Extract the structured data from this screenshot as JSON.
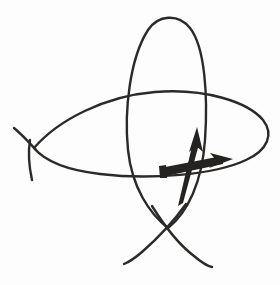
{
  "document": {
    "title": "Hand-drawn sketch",
    "kind": "freehand-ink-drawing",
    "description": "Two large intersecting hand-drawn loops (a tall vertical oval and a wide horizontal oval), each closing with a self-crossing and trailing ends, overlaid by two thick ink arrows meeting near the centre: one pointing up and one pointing right.",
    "width": 280,
    "height": 285
  },
  "canvas": {
    "background_color": "#fdfdfd",
    "ink_color": "#2b2a29",
    "thin_stroke_width": 2.2,
    "thick_arrow_color": "#242322"
  },
  "strokes": [
    {
      "name": "vertical-loop",
      "label": "Tall vertical oval loop with crossed tails at bottom",
      "color": "#2b2a29",
      "width": 2.4,
      "path": "M168 228 C 150 214, 132 188, 128 150 C 124 110, 130 58, 148 30 C 158 15, 178 13, 190 28 C 205 47, 208 96, 205 140 C 202 182, 188 212, 168 228"
    },
    {
      "name": "vertical-loop-left-tail",
      "label": "Left trailing tail of vertical loop",
      "color": "#2b2a29",
      "width": 2.4,
      "path": "M186 204 C 176 218, 158 238, 142 252 C 135 258, 129 262, 124 264"
    },
    {
      "name": "vertical-loop-right-tail",
      "label": "Right trailing tail of vertical loop",
      "color": "#2b2a29",
      "width": 2.4,
      "path": "M152 206 C 162 222, 178 244, 194 256 C 201 262, 207 266, 212 267"
    },
    {
      "name": "horizontal-loop",
      "label": "Wide horizontal oval loop with crossed tails at left",
      "color": "#2b2a29",
      "width": 2.4,
      "path": "M34 148 C 58 120, 105 96, 155 92 C 205 88, 248 102, 263 120 C 274 134, 268 150, 246 160 C 214 175, 150 180, 100 174 C 66 170, 44 160, 34 148"
    },
    {
      "name": "horizontal-loop-upper-tail",
      "label": "Upper-left trailing tail of horizontal loop",
      "color": "#2b2a29",
      "width": 2.4,
      "path": "M14 128 C 20 133, 28 141, 36 150"
    },
    {
      "name": "horizontal-loop-lower-tail",
      "label": "Lower-left trailing tail of horizontal loop",
      "color": "#2b2a29",
      "width": 2.4,
      "path": "M30 140 C 28 152, 29 166, 32 180"
    },
    {
      "name": "up-arrow-shaft",
      "label": "Thick ink shaft of the upward arrow",
      "color": "#242322",
      "path": "M183 203 L 178 206 L 193 142 L 199 144 Z"
    },
    {
      "name": "up-arrow-head",
      "label": "Arrowhead of the upward arrow pointing up",
      "color": "#242322",
      "path": "M197 127 L 203 152 L 196 146 L 189 152 Z"
    },
    {
      "name": "right-arrow-shaft",
      "label": "Thick ink shaft of the rightward arrow",
      "color": "#242322",
      "path": "M160 168 L 222 156 L 223 164 L 161 177 Z"
    },
    {
      "name": "right-arrow-tail-cap",
      "label": "Flat blunt tail cap of the rightward arrow",
      "color": "#242322",
      "path": "M159 166 L 166 165 L 167 178 L 160 178 Z"
    },
    {
      "name": "right-arrow-head",
      "label": "Arrowhead of the rightward arrow pointing right",
      "color": "#242322",
      "path": "M233 159 L 210 153 L 216 160 L 209 168 Z"
    }
  ]
}
